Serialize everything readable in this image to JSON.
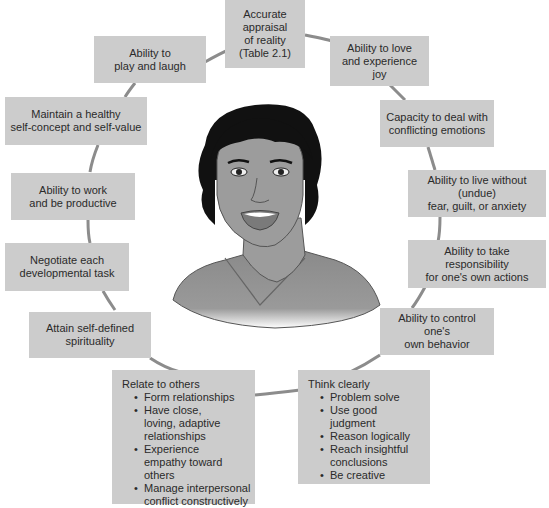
{
  "diagram": {
    "type": "circular-concept-map",
    "center": "illustration of a smiling woman (mentally healthy person)",
    "colors": {
      "box_fill": "#cccccc",
      "ring_line": "#8c8c8c",
      "text": "#2a2a2a"
    },
    "nodes": [
      {
        "id": "accurate-appraisal",
        "lines": [
          "Accurate",
          "appraisal",
          "of reality",
          "(Table 2.1)"
        ]
      },
      {
        "id": "love-joy",
        "lines": [
          "Ability to love",
          "and experience joy"
        ]
      },
      {
        "id": "conflicting-emotions",
        "lines": [
          "Capacity to deal with",
          "conflicting emotions"
        ]
      },
      {
        "id": "live-without-fear",
        "lines": [
          "Ability to live without (undue)",
          "fear, guilt, or anxiety"
        ]
      },
      {
        "id": "take-responsibility",
        "lines": [
          "Ability to take responsibility",
          "for one's own actions"
        ]
      },
      {
        "id": "control-behavior",
        "lines": [
          "Ability to control one's",
          "own behavior"
        ]
      },
      {
        "id": "think-clearly",
        "title": "Think clearly",
        "bullets": [
          "Problem solve",
          "Use good judgment",
          "Reason logically",
          "Reach insightful conclusions",
          "Be creative"
        ]
      },
      {
        "id": "relate-to-others",
        "title": "Relate to others",
        "bullets": [
          "Form relationships",
          "Have close, loving, adaptive relationships",
          "Experience empathy toward others",
          "Manage interpersonal conflict constructively"
        ]
      },
      {
        "id": "spirituality",
        "lines": [
          "Attain self-defined",
          "spirituality"
        ]
      },
      {
        "id": "developmental-task",
        "lines": [
          "Negotiate each",
          "developmental task"
        ]
      },
      {
        "id": "work-productive",
        "lines": [
          "Ability to work",
          "and be productive"
        ]
      },
      {
        "id": "self-concept",
        "lines": [
          "Maintain a healthy",
          "self-concept and self-value"
        ]
      },
      {
        "id": "play-laugh",
        "lines": [
          "Ability to",
          "play and laugh"
        ]
      }
    ]
  }
}
